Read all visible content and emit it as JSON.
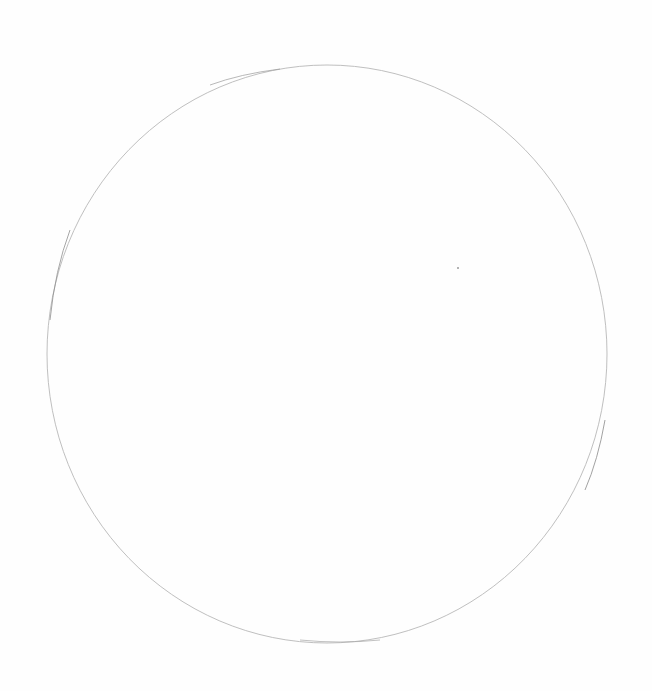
{
  "image": {
    "description": "Hand-drawn pencil circle on white paper",
    "width": 652,
    "height": 691,
    "background_color": "#fefefe",
    "stroke_color": "#b8b8b8",
    "stroke_color_dark": "#8a8a8a"
  },
  "circle": {
    "center_x": 327,
    "center_y": 354,
    "radius_x": 280,
    "radius_y": 289
  },
  "speck": {
    "x": 458,
    "y": 268
  }
}
